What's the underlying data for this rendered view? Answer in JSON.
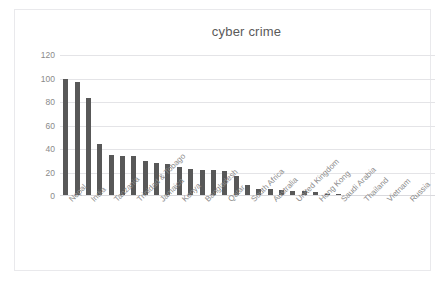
{
  "chart_data": {
    "type": "bar",
    "title": "cyber crime",
    "xlabel": "",
    "ylabel": "",
    "ylim": [
      0,
      120
    ],
    "yticks": [
      0,
      20,
      40,
      60,
      80,
      100,
      120
    ],
    "grid": true,
    "legend": false,
    "bar_color": "#585858",
    "categories": [
      "Nepal",
      "",
      "India",
      "",
      "Tanzania",
      "",
      "Trinidad & Tobago",
      "",
      "Jamaica",
      "",
      "Kenya",
      "",
      "Bangladesh",
      "",
      "Qatar",
      "",
      "South Africa",
      "",
      "Australia",
      "",
      "United Kingdom",
      "",
      "Hong Kong",
      "",
      "Saudi Arabia",
      "",
      "Thailand",
      "",
      "Vietnam",
      "",
      "Russia",
      "",
      ""
    ],
    "labeled_categories": [
      "Nepal",
      "India",
      "Tanzania",
      "Trinidad & Tobago",
      "Jamaica",
      "Kenya",
      "Bangladesh",
      "Qatar",
      "South Africa",
      "Australia",
      "United Kingdom",
      "Hong Kong",
      "Saudi Arabia",
      "Thailand",
      "Vietnam",
      "Russia"
    ],
    "values": [
      100,
      97,
      83,
      44,
      35,
      34,
      34,
      30,
      28,
      27,
      25,
      23,
      22,
      22,
      21,
      17,
      9,
      6,
      6,
      5,
      4.5,
      4,
      3.5,
      2,
      1.5,
      1.2,
      1,
      0.8,
      0.6,
      0.5,
      0.4,
      0.3,
      0.2
    ]
  },
  "chart": {
    "title": "cyber crime"
  }
}
